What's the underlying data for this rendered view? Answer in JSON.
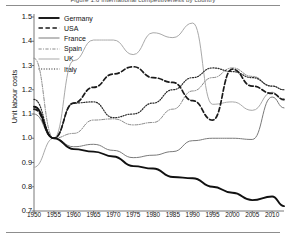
{
  "figure": {
    "title": "Figure 1.6  International competitiveness by country",
    "ylabel": "Unit labour costs"
  },
  "legend": {
    "items": [
      {
        "label": "Germany",
        "style": "thick-solid-black",
        "color": "#111111"
      },
      {
        "label": "USA",
        "style": "thick-dashed-black",
        "color": "#1a1a1a"
      },
      {
        "label": "France",
        "style": "solid-gray",
        "color": "#7a7a7a"
      },
      {
        "label": "Spain",
        "style": "dash-dot-gray",
        "color": "#8a8a8a"
      },
      {
        "label": "UK",
        "style": "solid-light-gray",
        "color": "#a9a9a9"
      },
      {
        "label": "Italy",
        "style": "dotted-black",
        "color": "#2b2b2b"
      }
    ]
  },
  "axes": {
    "y_ticks": [
      "1.5",
      "1.4",
      "1.3",
      "1.2",
      "1.1",
      "1.0",
      "0.9",
      "0.8",
      "0.7"
    ],
    "x_ticks": [
      "1950",
      "1955",
      "1960",
      "1965",
      "1970",
      "1975",
      "1980",
      "1985",
      "1990",
      "1995",
      "2000",
      "2005",
      "2010"
    ]
  },
  "chart_data": {
    "type": "line",
    "title": "Figure 1.6  International competitiveness by country",
    "xlabel": "",
    "ylabel": "Unit labour costs",
    "xlim": [
      1950,
      2013
    ],
    "ylim": [
      0.7,
      1.5
    ],
    "grid": false,
    "legend_position": "top-left",
    "x": [
      1950,
      1955,
      1960,
      1965,
      1970,
      1975,
      1980,
      1985,
      1990,
      1995,
      2000,
      2005,
      2010,
      2013
    ],
    "series": [
      {
        "name": "Germany",
        "color": "#111111",
        "dash": "none",
        "width": 1.9,
        "values": [
          1.13,
          1.0,
          0.955,
          0.945,
          0.925,
          0.885,
          0.875,
          0.84,
          0.835,
          0.8,
          0.775,
          0.745,
          0.76,
          0.72
        ]
      },
      {
        "name": "USA",
        "color": "#1a1a1a",
        "dash": "dashed",
        "width": 1.7,
        "values": [
          1.12,
          1.0,
          1.145,
          1.21,
          1.265,
          1.295,
          1.25,
          1.23,
          1.155,
          1.075,
          1.285,
          1.215,
          1.185,
          1.16
        ]
      },
      {
        "name": "France",
        "color": "#7a7a7a",
        "dash": "none",
        "width": 1.0,
        "values": [
          1.1,
          1.0,
          0.965,
          0.975,
          0.95,
          0.92,
          0.93,
          0.945,
          0.99,
          1.0,
          1.0,
          0.995,
          1.17,
          1.125
        ]
      },
      {
        "name": "Spain",
        "color": "#8a8a8a",
        "dash": "dash-dot",
        "width": 1.0,
        "values": [
          1.33,
          1.0,
          1.02,
          1.075,
          1.08,
          1.055,
          1.065,
          1.12,
          1.195,
          1.25,
          1.29,
          1.255,
          1.215,
          1.2
        ]
      },
      {
        "name": "UK",
        "color": "#a9a9a9",
        "dash": "none",
        "width": 1.0,
        "values": [
          0.88,
          1.0,
          1.32,
          1.405,
          1.405,
          1.345,
          1.435,
          1.415,
          1.475,
          1.14,
          1.15,
          1.115,
          1.19,
          1.155
        ]
      },
      {
        "name": "Italy",
        "color": "#2b2b2b",
        "dash": "dotted",
        "width": 1.2,
        "values": [
          1.16,
          1.0,
          1.145,
          1.15,
          1.085,
          1.1,
          1.145,
          1.2,
          1.25,
          1.29,
          1.275,
          1.25,
          1.215,
          1.2
        ]
      }
    ]
  }
}
